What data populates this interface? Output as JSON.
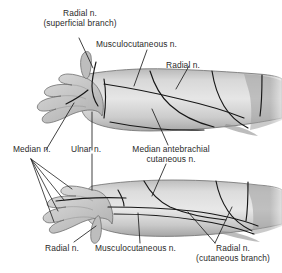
{
  "figure": {
    "background_color": "#ffffff",
    "skin_fill": "#c9c9c9",
    "skin_light": "#e2e2e2",
    "skin_shadow": "#9a9a9a",
    "line_color": "#1a1a1a",
    "text_color": "#2a2a2a"
  },
  "views": {
    "upper": {
      "name": "dorsal-view",
      "description": "Right upper limb, dorsal aspect, hand at left"
    },
    "lower": {
      "name": "palmar-view",
      "description": "Right upper limb, palmar aspect, hand at left"
    }
  },
  "labels": {
    "radial_superficial": {
      "line1": "Radial  n.",
      "line2": "(superficial branch)"
    },
    "musculocutaneous_top": {
      "line1": "Musculocutaneous n."
    },
    "radial_top": {
      "line1": "Radial n."
    },
    "median": {
      "line1": "Median n."
    },
    "ulnar": {
      "line1": "Ulnar n."
    },
    "median_antebrachial": {
      "line1": "Median antebrachial",
      "line2": "cutaneous n."
    },
    "radial_bottom": {
      "line1": "Radial n."
    },
    "musculocutaneous_bottom": {
      "line1": "Musculocutaneous n."
    },
    "radial_cutaneous": {
      "line1": "Radial n.",
      "line2": "(cutaneous branch)"
    }
  }
}
